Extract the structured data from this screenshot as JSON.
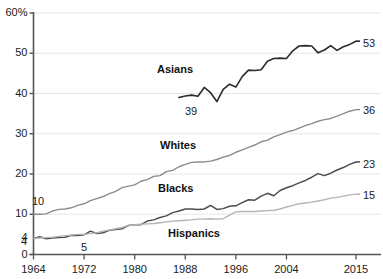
{
  "chart_data": {
    "type": "line",
    "title": "",
    "xlabel": "",
    "ylabel": "",
    "xlim": [
      1964,
      2015
    ],
    "ylim": [
      0,
      60
    ],
    "grid": true,
    "legend_position": "inline-labels",
    "x_tick_labels": [
      "1964",
      "1972",
      "1980",
      "1988",
      "1996",
      "2004",
      "2015"
    ],
    "x_ticks": [
      1964,
      1972,
      1980,
      1988,
      1996,
      2004,
      2015
    ],
    "y_tick_labels": [
      "60%",
      "50",
      "40",
      "30",
      "20",
      "10",
      "4",
      "0"
    ],
    "y_ticks": [
      60,
      50,
      40,
      30,
      20,
      10,
      4,
      0
    ],
    "series": [
      {
        "name": "Asians",
        "color": "#2b2b2b",
        "width": 1.6,
        "start_label": "39",
        "end_label": "53",
        "x": [
          1987,
          1988,
          1989,
          1990,
          1991,
          1992,
          1993,
          1994,
          1995,
          1996,
          1997,
          1998,
          1999,
          2000,
          2001,
          2002,
          2003,
          2004,
          2005,
          2006,
          2007,
          2008,
          2009,
          2010,
          2011,
          2012,
          2013,
          2014,
          2015
        ],
        "values": [
          39,
          39.4,
          39.6,
          39.3,
          41.5,
          40.2,
          38,
          41,
          42.3,
          41.6,
          44.2,
          45.8,
          45.7,
          45.9,
          48,
          48.7,
          48.8,
          48.7,
          50.6,
          51.8,
          51.9,
          51.8,
          50.1,
          50.8,
          51.9,
          50.7,
          51.6,
          52.2,
          53
        ]
      },
      {
        "name": "Whites",
        "color": "#8c8c8c",
        "width": 1.4,
        "start_label": "10",
        "end_label": "36",
        "x": [
          1964,
          1965,
          1966,
          1967,
          1968,
          1969,
          1970,
          1971,
          1972,
          1973,
          1974,
          1975,
          1976,
          1977,
          1978,
          1979,
          1980,
          1981,
          1982,
          1983,
          1984,
          1985,
          1986,
          1987,
          1988,
          1989,
          1990,
          1991,
          1992,
          1993,
          1994,
          1995,
          1996,
          1997,
          1998,
          1999,
          2000,
          2001,
          2002,
          2003,
          2004,
          2005,
          2006,
          2007,
          2008,
          2009,
          2010,
          2011,
          2012,
          2013,
          2014,
          2015
        ],
        "values": [
          10,
          10,
          10.1,
          10.8,
          11.2,
          11.3,
          11.6,
          12.2,
          12.6,
          13.4,
          13.9,
          14.4,
          15.1,
          15.7,
          16.6,
          17,
          17.3,
          18.2,
          18.6,
          19.4,
          19.6,
          20.6,
          20.9,
          21.8,
          22.4,
          22.9,
          23,
          23,
          23.2,
          23.6,
          24.2,
          24.6,
          25.4,
          26,
          26.6,
          27.2,
          28,
          28.4,
          29.2,
          29.8,
          30.4,
          30.8,
          31.4,
          32,
          32.5,
          33.1,
          33.5,
          33.8,
          34.4,
          35,
          35.6,
          36
        ]
      },
      {
        "name": "Blacks",
        "color": "#4d4d4d",
        "width": 1.5,
        "start_label": "4",
        "end_label": "23",
        "x": [
          1964,
          1965,
          1966,
          1967,
          1968,
          1969,
          1970,
          1971,
          1972,
          1973,
          1974,
          1975,
          1976,
          1977,
          1978,
          1979,
          1980,
          1981,
          1982,
          1983,
          1984,
          1985,
          1986,
          1987,
          1988,
          1989,
          1990,
          1991,
          1992,
          1993,
          1994,
          1995,
          1996,
          1997,
          1998,
          1999,
          2000,
          2001,
          2002,
          2003,
          2004,
          2005,
          2006,
          2007,
          2008,
          2009,
          2010,
          2011,
          2012,
          2013,
          2014,
          2015
        ],
        "values": [
          4,
          4.4,
          3.9,
          4.1,
          4.2,
          4.3,
          4.8,
          4.7,
          4.9,
          5.8,
          5.2,
          5.4,
          6,
          6.2,
          6.4,
          7.2,
          7.4,
          7.4,
          8.3,
          8.6,
          9.2,
          9.6,
          10.4,
          10.8,
          11.3,
          11.3,
          11.2,
          11.3,
          12.2,
          11.2,
          11.4,
          12,
          12.1,
          12.9,
          13.6,
          13.5,
          14.5,
          15.2,
          14.6,
          15.9,
          16.6,
          17.1,
          17.8,
          18.4,
          19.2,
          20.1,
          19.6,
          20.2,
          21,
          21.6,
          22.4,
          23
        ]
      },
      {
        "name": "Hispanics",
        "color": "#b5b5b5",
        "width": 1.4,
        "start_label": "5",
        "end_label": "15",
        "x": [
          1964,
          1965,
          1966,
          1967,
          1968,
          1969,
          1970,
          1971,
          1972,
          1973,
          1974,
          1975,
          1976,
          1977,
          1978,
          1979,
          1980,
          1981,
          1982,
          1983,
          1984,
          1985,
          1986,
          1987,
          1988,
          1989,
          1990,
          1991,
          1992,
          1993,
          1994,
          1995,
          1996,
          1997,
          1998,
          1999,
          2000,
          2001,
          2002,
          2003,
          2004,
          2005,
          2006,
          2007,
          2008,
          2009,
          2010,
          2011,
          2012,
          2013,
          2014,
          2015
        ],
        "values": [
          4,
          4.1,
          4.2,
          4.3,
          4.5,
          4.7,
          4.8,
          5,
          5,
          5.2,
          5.4,
          5.8,
          6.1,
          6.4,
          6.7,
          7.2,
          7.4,
          7.5,
          7.6,
          7.7,
          7.9,
          8.1,
          8.3,
          8.4,
          8.5,
          8.6,
          8.8,
          8.8,
          8.9,
          8.8,
          8.9,
          9.8,
          10.6,
          10.7,
          10.7,
          10.7,
          10.8,
          10.9,
          11,
          11.3,
          11.8,
          12.2,
          12.6,
          12.8,
          13,
          13.3,
          13.6,
          14,
          14.2,
          14.5,
          14.8,
          15
        ]
      }
    ],
    "inline_labels": [
      {
        "text": "Asians",
        "x_px": 157,
        "y_px": 64
      },
      {
        "text": "Whites",
        "x_px": 160,
        "y_px": 140
      },
      {
        "text": "Blacks",
        "x_px": 158,
        "y_px": 183
      },
      {
        "text": "Hispanics",
        "x_px": 168,
        "y_px": 228
      }
    ],
    "annotations": [
      {
        "text": "39",
        "x_px": 185,
        "y_px": 106
      },
      {
        "text": "10",
        "x_px": 32,
        "y_px": 196
      },
      {
        "text": "4",
        "x_px": 21,
        "y_px": 236
      },
      {
        "text": "5",
        "x_px": 81,
        "y_px": 242
      },
      {
        "text": "53",
        "x_px": 363,
        "y_px": 38
      },
      {
        "text": "36",
        "x_px": 363,
        "y_px": 105
      },
      {
        "text": "23",
        "x_px": 363,
        "y_px": 159
      },
      {
        "text": "15",
        "x_px": 363,
        "y_px": 190
      }
    ],
    "colors": {
      "axis": "#555555",
      "grid": "#e6e6e6",
      "text": "#1a1a1a",
      "background": "#ffffff"
    }
  }
}
